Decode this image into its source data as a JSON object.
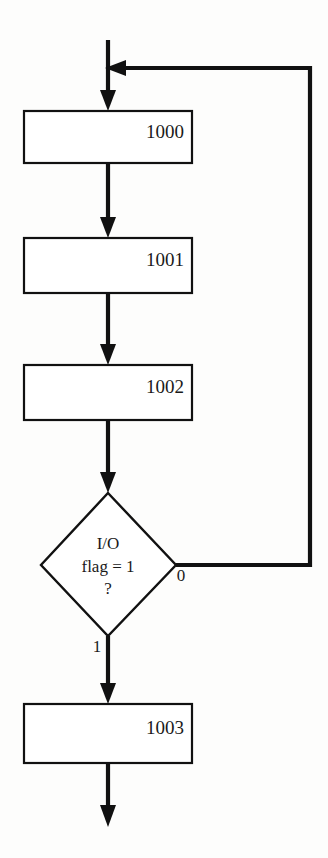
{
  "diagram": {
    "type": "flowchart",
    "background_color": "#fdfdfc",
    "line_color": "#111111",
    "nodes": [
      {
        "id": "node-1000",
        "shape": "process",
        "label": "1000",
        "label_align": "top-right"
      },
      {
        "id": "node-1001",
        "shape": "process",
        "label": "1001",
        "label_align": "top-right"
      },
      {
        "id": "node-1002",
        "shape": "process",
        "label": "1002",
        "label_align": "top-right"
      },
      {
        "id": "node-decision",
        "shape": "decision",
        "line1": "I/O",
        "line2": "flag = 1",
        "line3": "?"
      },
      {
        "id": "node-1003",
        "shape": "process",
        "label": "1003",
        "label_align": "top-right"
      }
    ],
    "branch_labels": {
      "false_branch": "0",
      "true_branch": "1"
    },
    "edges": [
      {
        "from": "entry",
        "to": "node-1000",
        "label": ""
      },
      {
        "from": "node-1000",
        "to": "node-1001",
        "label": ""
      },
      {
        "from": "node-1001",
        "to": "node-1002",
        "label": ""
      },
      {
        "from": "node-1002",
        "to": "node-decision",
        "label": ""
      },
      {
        "from": "node-decision",
        "to": "node-1000",
        "label": "0"
      },
      {
        "from": "node-decision",
        "to": "node-1003",
        "label": "1"
      },
      {
        "from": "node-1003",
        "to": "exit",
        "label": ""
      }
    ]
  }
}
